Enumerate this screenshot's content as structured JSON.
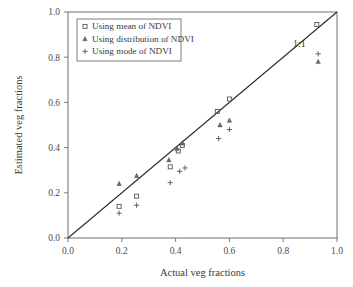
{
  "chart_data": {
    "type": "scatter",
    "title": "",
    "xlabel": "Actual veg fractions",
    "ylabel": "Estimated veg fractions",
    "xlim": [
      0.0,
      1.0
    ],
    "ylim": [
      0.0,
      1.0
    ],
    "xticks": [
      "0.0",
      "0.2",
      "0.4",
      "0.6",
      "0.8",
      "1.0"
    ],
    "yticks": [
      "0.0",
      "0.2",
      "0.4",
      "0.6",
      "0.8",
      "1.0"
    ],
    "xtick_values": [
      0.0,
      0.2,
      0.4,
      0.6,
      0.8,
      1.0
    ],
    "ytick_values": [
      0.0,
      0.2,
      0.4,
      0.6,
      0.8,
      1.0
    ],
    "grid": false,
    "legend_position": "upper-left",
    "annotations": [
      {
        "text": "1:1",
        "x": 0.86,
        "y": 0.845
      }
    ],
    "reference_line": {
      "label": "1:1",
      "from": [
        0.0,
        0.0
      ],
      "to": [
        1.0,
        1.0
      ]
    },
    "series": [
      {
        "name": "Using mean of NDVI",
        "marker": "square",
        "points": [
          {
            "x": 0.19,
            "y": 0.14
          },
          {
            "x": 0.255,
            "y": 0.185
          },
          {
            "x": 0.38,
            "y": 0.315
          },
          {
            "x": 0.41,
            "y": 0.385
          },
          {
            "x": 0.425,
            "y": 0.41
          },
          {
            "x": 0.555,
            "y": 0.56
          },
          {
            "x": 0.6,
            "y": 0.615
          },
          {
            "x": 0.925,
            "y": 0.945
          }
        ]
      },
      {
        "name": "Using distribution of NDVI",
        "marker": "triangle",
        "points": [
          {
            "x": 0.19,
            "y": 0.24
          },
          {
            "x": 0.255,
            "y": 0.275
          },
          {
            "x": 0.375,
            "y": 0.345
          },
          {
            "x": 0.405,
            "y": 0.395
          },
          {
            "x": 0.425,
            "y": 0.42
          },
          {
            "x": 0.565,
            "y": 0.5
          },
          {
            "x": 0.6,
            "y": 0.52
          },
          {
            "x": 0.93,
            "y": 0.78
          }
        ]
      },
      {
        "name": "Using mode of NDVI",
        "marker": "plus",
        "points": [
          {
            "x": 0.19,
            "y": 0.11
          },
          {
            "x": 0.255,
            "y": 0.145
          },
          {
            "x": 0.38,
            "y": 0.245
          },
          {
            "x": 0.415,
            "y": 0.295
          },
          {
            "x": 0.435,
            "y": 0.31
          },
          {
            "x": 0.56,
            "y": 0.44
          },
          {
            "x": 0.6,
            "y": 0.48
          },
          {
            "x": 0.93,
            "y": 0.815
          }
        ]
      }
    ]
  }
}
